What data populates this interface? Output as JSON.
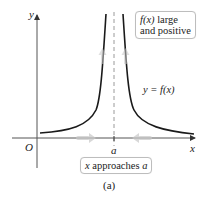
{
  "figure": {
    "caption": "(a)",
    "y_axis_label": "y",
    "x_axis_label": "x",
    "origin_label": "O",
    "asymptote_label": "a",
    "curve_label": "y = f(x)",
    "top_box": {
      "line1_fx": "f(x)",
      "line1_rest": " large",
      "line2": "and positive"
    },
    "bottom_box": {
      "x": "x",
      "middle": " approaches ",
      "a": "a"
    }
  },
  "colors": {
    "axis": "#555555",
    "curve": "#1a1a1a",
    "asymptote": "#9a9a9a",
    "arrows": "#c8c8c8",
    "box_border": "#bdbdbd"
  }
}
